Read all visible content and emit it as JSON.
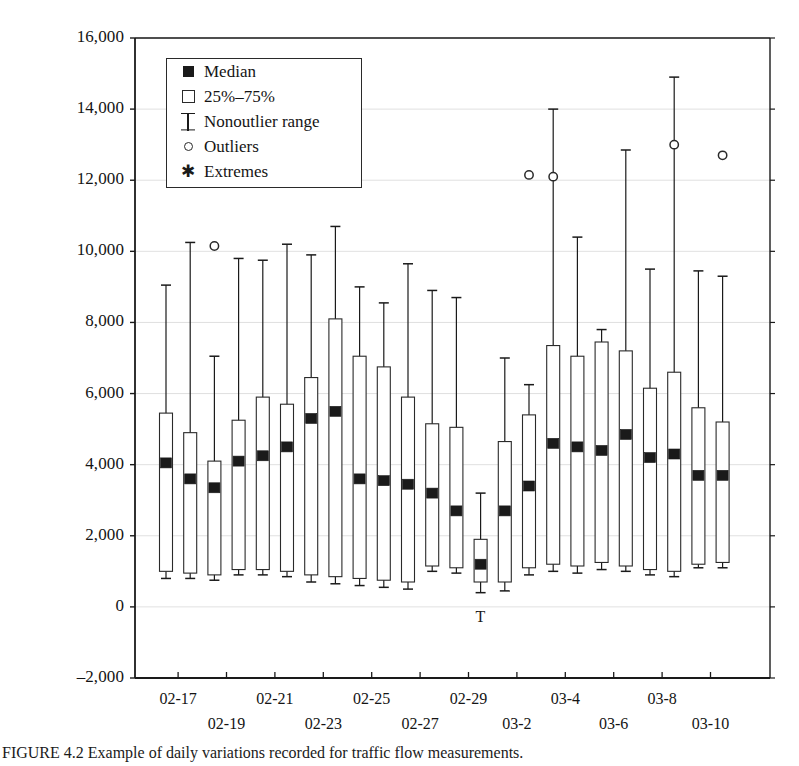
{
  "figure": {
    "caption": "FIGURE 4.2   Example of daily variations recorded for traffic flow measurements."
  },
  "legend": {
    "items": [
      {
        "symbol": "filled-square",
        "label": "Median"
      },
      {
        "symbol": "open-square",
        "label": "25%–75%"
      },
      {
        "symbol": "whisker",
        "label": "Nonoutlier range"
      },
      {
        "symbol": "open-circle",
        "label": "Outliers"
      },
      {
        "symbol": "asterisk",
        "label": "Extremes"
      }
    ]
  },
  "axes": {
    "y": {
      "label": "",
      "min": -2000,
      "max": 16000,
      "step": 2000,
      "ticks": [
        "16,000",
        "14,000",
        "12,000",
        "10,000",
        "8,000",
        "6,000",
        "4,000",
        "2,000",
        "0",
        "–2,000"
      ],
      "tick_values": [
        16000,
        14000,
        12000,
        10000,
        8000,
        6000,
        4000,
        2000,
        0,
        -2000
      ]
    },
    "x": {
      "label": "",
      "ticks": [
        "02-17",
        "02-19",
        "02-21",
        "02-23",
        "02-25",
        "02-27",
        "02-29",
        "03-2",
        "03-4",
        "03-6",
        "03-8",
        "03-10"
      ],
      "tick_box_index": [
        1,
        3,
        5,
        7,
        9,
        11,
        13,
        15,
        17,
        19,
        21,
        23
      ]
    }
  },
  "annotations": {
    "t_mark": "T"
  },
  "chart_data": {
    "type": "box",
    "title": "",
    "xlabel": "",
    "ylabel": "",
    "ylim": [
      -2000,
      16000
    ],
    "grid": true,
    "legend_position": "top-left-inside",
    "categories": [
      "02-16",
      "02-17",
      "02-18",
      "02-19",
      "02-20",
      "02-21",
      "02-22",
      "02-23",
      "02-24",
      "02-25",
      "02-26",
      "02-27",
      "02-28",
      "02-29",
      "03-1",
      "03-2",
      "03-3",
      "03-4",
      "03-5",
      "03-6",
      "03-7",
      "03-8",
      "03-9"
    ],
    "tick_labels_shown": [
      "02-17",
      "02-19",
      "02-21",
      "02-23",
      "02-25",
      "02-27",
      "02-29",
      "03-2",
      "03-4",
      "03-6",
      "03-8",
      "03-10"
    ],
    "boxes": [
      {
        "category": "02-16",
        "whisker_low": 800,
        "q1": 1000,
        "median": 4050,
        "q3": 5450,
        "whisker_high": 9050,
        "outliers": []
      },
      {
        "category": "02-17",
        "whisker_low": 800,
        "q1": 950,
        "median": 3600,
        "q3": 4900,
        "whisker_high": 10250,
        "outliers": []
      },
      {
        "category": "02-18",
        "whisker_low": 750,
        "q1": 900,
        "median": 3350,
        "q3": 4100,
        "whisker_high": 7050,
        "outliers": [
          10150
        ]
      },
      {
        "category": "02-19",
        "whisker_low": 900,
        "q1": 1050,
        "median": 4100,
        "q3": 5250,
        "whisker_high": 9800,
        "outliers": []
      },
      {
        "category": "02-20",
        "whisker_low": 900,
        "q1": 1050,
        "median": 4250,
        "q3": 5900,
        "whisker_high": 9750,
        "outliers": []
      },
      {
        "category": "02-21",
        "whisker_low": 850,
        "q1": 1000,
        "median": 4500,
        "q3": 5700,
        "whisker_high": 10200,
        "outliers": []
      },
      {
        "category": "02-22",
        "whisker_low": 700,
        "q1": 900,
        "median": 5300,
        "q3": 6450,
        "whisker_high": 9900,
        "outliers": []
      },
      {
        "category": "02-23",
        "whisker_low": 650,
        "q1": 850,
        "median": 5500,
        "q3": 8100,
        "whisker_high": 10700,
        "outliers": []
      },
      {
        "category": "02-24",
        "whisker_low": 600,
        "q1": 800,
        "median": 3600,
        "q3": 7050,
        "whisker_high": 9000,
        "outliers": []
      },
      {
        "category": "02-25",
        "whisker_low": 550,
        "q1": 750,
        "median": 3550,
        "q3": 6750,
        "whisker_high": 8550,
        "outliers": []
      },
      {
        "category": "02-26",
        "whisker_low": 500,
        "q1": 700,
        "median": 3450,
        "q3": 5900,
        "whisker_high": 9650,
        "outliers": []
      },
      {
        "category": "02-27",
        "whisker_low": 1000,
        "q1": 1150,
        "median": 3200,
        "q3": 5150,
        "whisker_high": 8900,
        "outliers": []
      },
      {
        "category": "02-28",
        "whisker_low": 950,
        "q1": 1100,
        "median": 2700,
        "q3": 5050,
        "whisker_high": 8700,
        "outliers": []
      },
      {
        "category": "02-29",
        "whisker_low": 400,
        "q1": 700,
        "median": 1200,
        "q3": 1900,
        "whisker_high": 3200,
        "outliers": []
      },
      {
        "category": "03-1",
        "whisker_low": 450,
        "q1": 700,
        "median": 2700,
        "q3": 4650,
        "whisker_high": 7000,
        "outliers": []
      },
      {
        "category": "03-2",
        "whisker_low": 900,
        "q1": 1100,
        "median": 3400,
        "q3": 5400,
        "whisker_high": 6250,
        "outliers": [
          12150
        ]
      },
      {
        "category": "03-3",
        "whisker_low": 1000,
        "q1": 1200,
        "median": 4600,
        "q3": 7350,
        "whisker_high": 14000,
        "outliers": [
          12100
        ]
      },
      {
        "category": "03-4",
        "whisker_low": 950,
        "q1": 1150,
        "median": 4500,
        "q3": 7050,
        "whisker_high": 10400,
        "outliers": []
      },
      {
        "category": "03-5",
        "whisker_low": 1050,
        "q1": 1250,
        "median": 4400,
        "q3": 7450,
        "whisker_high": 7800,
        "outliers": []
      },
      {
        "category": "03-6",
        "whisker_low": 1000,
        "q1": 1150,
        "median": 4850,
        "q3": 7200,
        "whisker_high": 12850,
        "outliers": []
      },
      {
        "category": "03-7",
        "whisker_low": 900,
        "q1": 1050,
        "median": 4200,
        "q3": 6150,
        "whisker_high": 9500,
        "outliers": []
      },
      {
        "category": "03-8",
        "whisker_low": 850,
        "q1": 1000,
        "median": 4300,
        "q3": 6600,
        "whisker_high": 14900,
        "outliers": [
          13000
        ]
      },
      {
        "category": "03-9",
        "whisker_low": 1100,
        "q1": 1200,
        "median": 3700,
        "q3": 5600,
        "whisker_high": 9450,
        "outliers": []
      },
      {
        "category": "03-10",
        "whisker_low": 1100,
        "q1": 1250,
        "median": 3700,
        "q3": 5200,
        "whisker_high": 9300,
        "outliers": [
          12700
        ]
      }
    ]
  }
}
